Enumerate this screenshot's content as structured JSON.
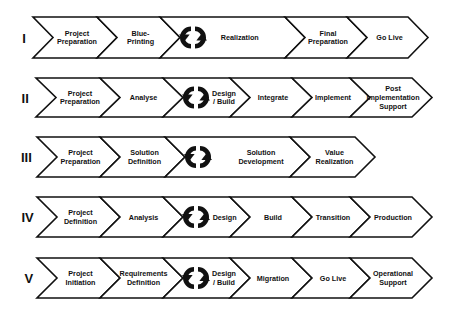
{
  "diagram": {
    "title": "",
    "rows": [
      {
        "numeral": "I",
        "top": 17,
        "bottom": 58,
        "bounds": [
          33,
          97,
          160,
          285,
          347,
          408
        ],
        "steps": [
          {
            "lines": [
              "Project",
              "Preparation"
            ],
            "cycle": false
          },
          {
            "lines": [
              "Blue-",
              "Printing"
            ],
            "cycle": false
          },
          {
            "lines": [
              "Realization"
            ],
            "cycle": true
          },
          {
            "lines": [
              "Final",
              "Preparation"
            ],
            "cycle": false
          },
          {
            "lines": [
              "Go Live"
            ],
            "cycle": false
          }
        ]
      },
      {
        "numeral": "II",
        "top": 78,
        "bottom": 117,
        "bounds": [
          36,
          100,
          163,
          230,
          292,
          350,
          412
        ],
        "steps": [
          {
            "lines": [
              "Project",
              "Preparation"
            ],
            "cycle": false
          },
          {
            "lines": [
              "Analyse"
            ],
            "cycle": false
          },
          {
            "lines": [
              "Design",
              "/ Build"
            ],
            "cycle": true
          },
          {
            "lines": [
              "Integrate"
            ],
            "cycle": false
          },
          {
            "lines": [
              "Implement"
            ],
            "cycle": false
          },
          {
            "lines": [
              "Post",
              "Implementation",
              "Support"
            ],
            "cycle": false
          }
        ]
      },
      {
        "numeral": "III",
        "top": 137,
        "bottom": 177,
        "bounds": [
          37,
          100,
          165,
          290,
          355
        ],
        "steps": [
          {
            "lines": [
              "Project",
              "Preparation"
            ],
            "cycle": false
          },
          {
            "lines": [
              "Solution",
              "Definition"
            ],
            "cycle": false
          },
          {
            "lines": [
              "Solution",
              "Development"
            ],
            "cycle": true
          },
          {
            "lines": [
              "Value",
              "Realization"
            ],
            "cycle": false
          }
        ]
      },
      {
        "numeral": "IV",
        "top": 197,
        "bottom": 237,
        "bounds": [
          37,
          100,
          163,
          230,
          292,
          350,
          412
        ],
        "steps": [
          {
            "lines": [
              "Project",
              "Definition"
            ],
            "cycle": false
          },
          {
            "lines": [
              "Analysis"
            ],
            "cycle": false
          },
          {
            "lines": [
              "Design"
            ],
            "cycle": true
          },
          {
            "lines": [
              "Build"
            ],
            "cycle": false
          },
          {
            "lines": [
              "Transition"
            ],
            "cycle": false
          },
          {
            "lines": [
              "Production"
            ],
            "cycle": false
          }
        ]
      },
      {
        "numeral": "V",
        "top": 258,
        "bottom": 298,
        "bounds": [
          37,
          100,
          163,
          230,
          292,
          350,
          412
        ],
        "steps": [
          {
            "lines": [
              "Project",
              "Initiation"
            ],
            "cycle": false
          },
          {
            "lines": [
              "Requirements",
              "Definition"
            ],
            "cycle": false
          },
          {
            "lines": [
              "Design",
              "/ Build"
            ],
            "cycle": true
          },
          {
            "lines": [
              "Migration"
            ],
            "cycle": false
          },
          {
            "lines": [
              "Go Live"
            ],
            "cycle": false
          },
          {
            "lines": [
              "Operational",
              "Support"
            ],
            "cycle": false
          }
        ]
      }
    ],
    "notch_depth": 20,
    "icons": {
      "cycle": "circular-arrows-icon"
    }
  }
}
